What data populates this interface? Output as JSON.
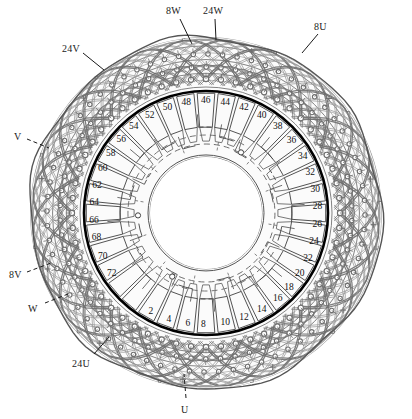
{
  "figure": {
    "kind": "patent-line-drawing",
    "center": {
      "cx": 206,
      "cy": 213
    },
    "radii": {
      "outer_mesh": 176,
      "boundary_circle": 122,
      "slot_label_ring": 112,
      "inner_hub": 58,
      "inner_arcs_outer": 86
    },
    "colors": {
      "ink": "#2b2b2b",
      "mesh": "#6f6f6f",
      "mesh_light": "#9a9a9a",
      "boundary": "#000000",
      "background": "#ffffff"
    },
    "boundary_stroke_width": 2.6
  },
  "callouts": [
    {
      "id": "c-8w",
      "text": "8W",
      "x": 166,
      "y": 5,
      "lx": 180,
      "ly": 19,
      "tx": 192,
      "ty": 44
    },
    {
      "id": "c-24w",
      "text": "24W",
      "x": 203,
      "y": 5,
      "lx": 215,
      "ly": 19,
      "tx": 216,
      "ty": 40
    },
    {
      "id": "c-8u",
      "text": "8U",
      "x": 314,
      "y": 21,
      "lx": 318,
      "ly": 34,
      "tx": 302,
      "ty": 53
    },
    {
      "id": "c-24v",
      "text": "24V",
      "x": 62,
      "y": 43,
      "lx": 83,
      "ly": 53,
      "tx": 104,
      "ty": 70
    },
    {
      "id": "c-v",
      "text": "V",
      "x": 14,
      "y": 131,
      "lx": 27,
      "ly": 139,
      "tx": 49,
      "ty": 148
    },
    {
      "id": "c-8v",
      "text": "8V",
      "x": 9,
      "y": 269,
      "lx": 27,
      "ly": 272,
      "tx": 51,
      "ty": 263
    },
    {
      "id": "c-w",
      "text": "W",
      "x": 28,
      "y": 303,
      "lx": 45,
      "ly": 303,
      "tx": 68,
      "ty": 294
    },
    {
      "id": "c-24u",
      "text": "24U",
      "x": 72,
      "y": 358,
      "lx": 94,
      "ly": 354,
      "tx": 109,
      "ty": 337
    },
    {
      "id": "c-u",
      "text": "U",
      "x": 181,
      "y": 404,
      "lx": 186,
      "ly": 398,
      "tx": 184,
      "ty": 374
    }
  ],
  "slot_numbers": [
    {
      "label": "2",
      "angle": 118
    },
    {
      "label": "4",
      "angle": 108
    },
    {
      "label": "6",
      "angle": 98
    },
    {
      "label": "8",
      "angle": 90
    },
    {
      "label": "10",
      "angle": 80
    },
    {
      "label": "12",
      "angle": 70
    },
    {
      "label": "14",
      "angle": 60
    },
    {
      "label": "16",
      "angle": 50
    },
    {
      "label": "18",
      "angle": 42
    },
    {
      "label": "20",
      "angle": 33
    },
    {
      "label": "22",
      "angle": 24
    },
    {
      "label": "24",
      "angle": 15
    },
    {
      "label": "26",
      "angle": 6
    },
    {
      "label": "28",
      "angle": -3
    },
    {
      "label": "30",
      "angle": -12
    },
    {
      "label": "32",
      "angle": -21
    },
    {
      "label": "34",
      "angle": -30
    },
    {
      "label": "36",
      "angle": -40
    },
    {
      "label": "38",
      "angle": -50
    },
    {
      "label": "40",
      "angle": -60
    },
    {
      "label": "42",
      "angle": -70
    },
    {
      "label": "44",
      "angle": -80
    },
    {
      "label": "46",
      "angle": -90
    },
    {
      "label": "48",
      "angle": -100
    },
    {
      "label": "50",
      "angle": -110
    },
    {
      "label": "52",
      "angle": -120
    },
    {
      "label": "54",
      "angle": -130
    },
    {
      "label": "56",
      "angle": -139
    },
    {
      "label": "58",
      "angle": -148
    },
    {
      "label": "60",
      "angle": -157
    },
    {
      "label": "62",
      "angle": -166
    },
    {
      "label": "64",
      "angle": -175
    },
    {
      "label": "66",
      "angle": 176
    },
    {
      "label": "68",
      "angle": 167
    },
    {
      "label": "70",
      "angle": 157
    },
    {
      "label": "72",
      "angle": 147
    }
  ],
  "mesh": {
    "loop_count": 72,
    "ring_count": 7,
    "node_ring_count": 3,
    "description": "interleaved end-turn coil loops forming woven crosshatch with circular lead nodes"
  },
  "slot_segments": {
    "count": 36,
    "description": "radial rectangular conductor segments between boundary circle and label ring"
  },
  "inner_arcs": {
    "count": 24,
    "description": "concentric arc bus-bar segments with dashed phase jumpers and terminal dots"
  }
}
